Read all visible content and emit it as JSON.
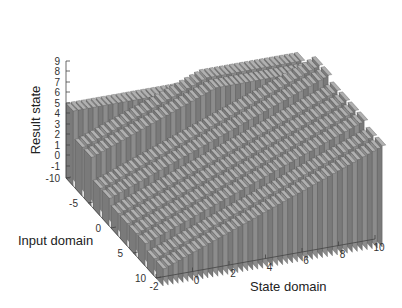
{
  "chart_data": {
    "type": "surface3d",
    "title": "",
    "xlabel": "State domain",
    "ylabel": "Input domain",
    "zlabel": "Result state",
    "x_ticks": [
      "-2",
      "0",
      "2",
      "4",
      "6",
      "8",
      "10"
    ],
    "y_ticks": [
      "-10",
      "-5",
      "0",
      "5",
      "10"
    ],
    "z_ticks": [
      "9",
      "8",
      "7",
      "6",
      "5",
      "4",
      "3",
      "2",
      "1",
      "0",
      "-1",
      "-10"
    ],
    "xlim": [
      -2,
      10
    ],
    "ylim": [
      -10,
      10
    ],
    "zlim": [
      -10,
      9
    ],
    "grid": false,
    "legend": null,
    "style": "stacked gray ribbons (staircase surface), light from upper-left",
    "surface_color": "#8a8a8a",
    "edge_color": "#3a3a3a"
  },
  "axes": {
    "x_title": "State domain",
    "y_title": "Input domain",
    "z_title": "Result state"
  }
}
